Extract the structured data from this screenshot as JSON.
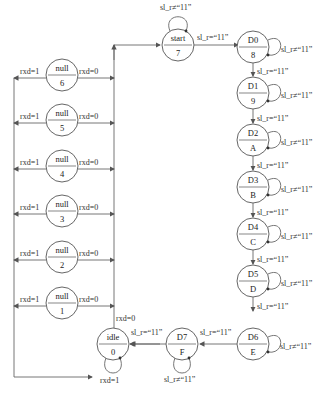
{
  "diagram": {
    "type": "state-machine",
    "states": [
      {
        "id": "start",
        "name": "start",
        "code": "7"
      },
      {
        "id": "d0",
        "name": "D0",
        "code": "8"
      },
      {
        "id": "d1",
        "name": "D1",
        "code": "9"
      },
      {
        "id": "d2",
        "name": "D2",
        "code": "A"
      },
      {
        "id": "d3",
        "name": "D3",
        "code": "B"
      },
      {
        "id": "d4",
        "name": "D4",
        "code": "C"
      },
      {
        "id": "d5",
        "name": "D5",
        "code": "D"
      },
      {
        "id": "d6",
        "name": "D6",
        "code": "E"
      },
      {
        "id": "d7",
        "name": "D7",
        "code": "F"
      },
      {
        "id": "idle",
        "name": "idle",
        "code": "0"
      },
      {
        "id": "null6",
        "name": "null",
        "code": "6"
      },
      {
        "id": "null5",
        "name": "null",
        "code": "5"
      },
      {
        "id": "null4",
        "name": "null",
        "code": "4"
      },
      {
        "id": "null3",
        "name": "null",
        "code": "3"
      },
      {
        "id": "null2",
        "name": "null",
        "code": "2"
      },
      {
        "id": "null1",
        "name": "null",
        "code": "1"
      }
    ],
    "labels": {
      "eq": "sl_r=“11”",
      "neq": "sl_r≠“11”",
      "rxd0": "rxd=0",
      "rxd1": "rxd=1"
    }
  }
}
